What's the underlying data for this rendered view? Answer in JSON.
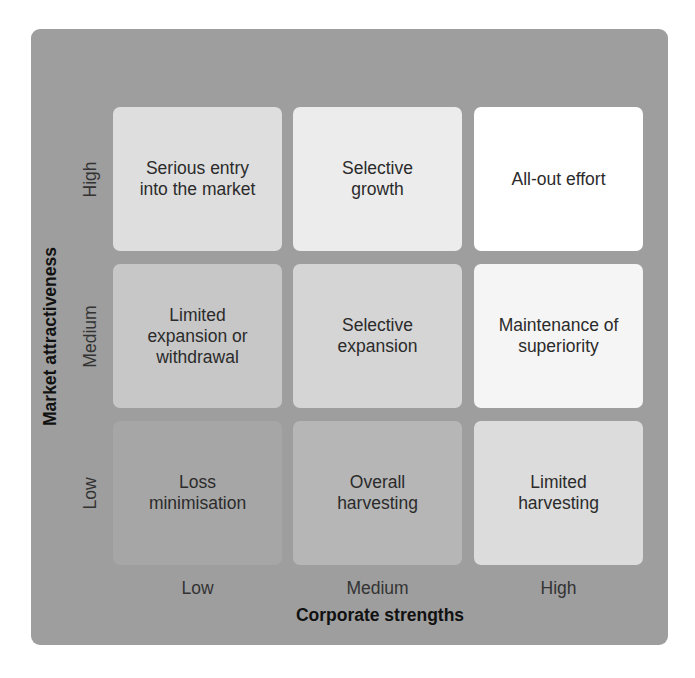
{
  "diagram": {
    "type": "matrix_3x3",
    "x_axis": {
      "title": "Corporate strengths",
      "levels": [
        "Low",
        "Medium",
        "High"
      ]
    },
    "y_axis": {
      "title": "Market attractiveness",
      "levels_top_to_bottom": [
        "High",
        "Medium",
        "Low"
      ]
    },
    "rows": [
      {
        "level": "High",
        "cells": [
          {
            "text": "Serious entry\ninto the market",
            "color": "#dedede"
          },
          {
            "text": "Selective\ngrowth",
            "color": "#ececec"
          },
          {
            "text": "All-out effort",
            "color": "#ffffff"
          }
        ]
      },
      {
        "level": "Medium",
        "cells": [
          {
            "text": "Limited\nexpansion or\nwithdrawal",
            "color": "#c7c7c7"
          },
          {
            "text": "Selective\nexpansion",
            "color": "#d5d5d5"
          },
          {
            "text": "Maintenance of\nsuperiority",
            "color": "#f5f5f5"
          }
        ]
      },
      {
        "level": "Low",
        "cells": [
          {
            "text": "Loss\nminimisation",
            "color": "#a6a6a6"
          },
          {
            "text": "Overall\nharvesting",
            "color": "#b6b6b6"
          },
          {
            "text": "Limited\nharvesting",
            "color": "#dcdcdc"
          }
        ]
      }
    ],
    "colors": {
      "panel_background": "#9e9e9e",
      "text": "#2b2b2b"
    }
  }
}
